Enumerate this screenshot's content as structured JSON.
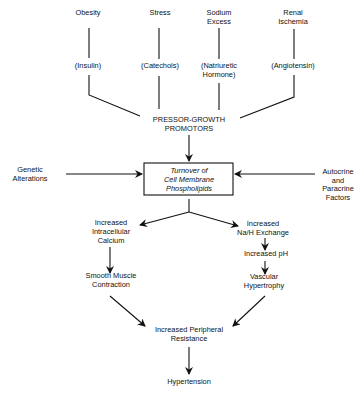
{
  "diagram": {
    "causes": [
      {
        "label_lines": [
          "Obesity"
        ],
        "mediator_lines": [
          "(Insulin)"
        ]
      },
      {
        "label_lines": [
          "Stress"
        ],
        "mediator_lines": [
          "(Catechols)"
        ]
      },
      {
        "label_lines": [
          "Sodium",
          "Excess"
        ],
        "mediator_lines": [
          "(Natriuretic",
          "Hormone)"
        ]
      },
      {
        "label_lines": [
          "Renal",
          "Ischemia"
        ],
        "mediator_lines": [
          "(Angiotensin)"
        ]
      }
    ],
    "promotors": [
      "PRESSOR-GROWTH",
      "PROMOTORS"
    ],
    "central_box": [
      "Turnover of",
      "Cell Membrane",
      "Phospholipids"
    ],
    "left_input": [
      "Genetic",
      "Alterations"
    ],
    "right_input": [
      "Autocrine",
      "and",
      "Paracrine",
      "Factors"
    ],
    "left_branch": {
      "step1": [
        "Increased",
        "Intracellular",
        "Calcium"
      ],
      "step2": [
        "Smooth Muscle",
        "Contraction"
      ]
    },
    "right_branch": {
      "step1": [
        "Increased",
        "Na/H Exchange"
      ],
      "step2": [
        "Increased pH"
      ],
      "step3": [
        "Vascular",
        "Hypertrophy"
      ]
    },
    "convergence": [
      "Increased Peripheral",
      "Resistance"
    ],
    "outcome": [
      "Hypertension"
    ],
    "colors": {
      "ink": "#111111",
      "background": "#ffffff"
    }
  }
}
